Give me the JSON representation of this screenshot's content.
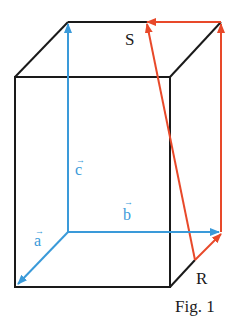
{
  "figure": {
    "caption": "Fig. 1",
    "colors": {
      "edge": "#1a1a1a",
      "blue": "#3a9ad9",
      "red": "#e8492a"
    },
    "labels": {
      "S": "S",
      "R": "R",
      "a": "a",
      "b": "b",
      "c": "c",
      "vec_arrow": "→"
    }
  }
}
